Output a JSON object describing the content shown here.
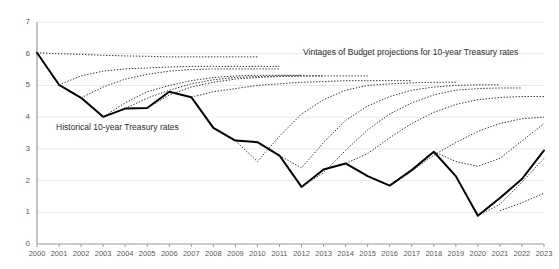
{
  "chart_data": {
    "type": "line",
    "title": "",
    "xlabel": "",
    "ylabel": "",
    "xlim": [
      2000,
      2023
    ],
    "ylim": [
      0,
      7
    ],
    "grid": true,
    "legend_position": "inline-annotations",
    "y_ticks": [
      "0",
      "1",
      "2",
      "3",
      "4",
      "5",
      "6",
      "7"
    ],
    "x_ticks": [
      "2000",
      "2001",
      "2002",
      "2003",
      "2004",
      "2005",
      "2006",
      "2007",
      "2008",
      "2009",
      "2010",
      "2011",
      "2012",
      "2013",
      "2014",
      "2015",
      "2016",
      "2017",
      "2018",
      "2019",
      "2020",
      "2021",
      "2022",
      "2023"
    ],
    "annotations": [
      {
        "name": "historical-label",
        "text": "Historical 10-year Treasury rates"
      },
      {
        "name": "vintages-label",
        "text": "Vintages of Budget projections for 10-year Treasury rates"
      }
    ],
    "series": [
      {
        "name": "Historical 10-year Treasury rates",
        "style": "solid",
        "color": "#000000",
        "x": [
          2000,
          2001,
          2002,
          2003,
          2004,
          2005,
          2006,
          2007,
          2008,
          2009,
          2010,
          2011,
          2012,
          2013,
          2014,
          2015,
          2016,
          2017,
          2018,
          2019,
          2020,
          2021,
          2022,
          2023
        ],
        "values": [
          6.03,
          5.02,
          4.61,
          4.01,
          4.27,
          4.29,
          4.8,
          4.63,
          3.66,
          3.26,
          3.21,
          2.79,
          1.8,
          2.35,
          2.54,
          2.14,
          1.84,
          2.33,
          2.91,
          2.14,
          0.89,
          1.45,
          2.05,
          2.95
        ]
      },
      {
        "name": "Budget projection vintage 2000",
        "style": "dotted",
        "color": "#333333",
        "x": [
          2000,
          2001,
          2002,
          2003,
          2004,
          2005,
          2006,
          2007,
          2008,
          2009,
          2010
        ],
        "values": [
          6.03,
          6.0,
          5.98,
          5.95,
          5.93,
          5.92,
          5.9,
          5.9,
          5.9,
          5.9,
          5.9
        ]
      },
      {
        "name": "Budget projection vintage 2001",
        "style": "dotted",
        "color": "#333333",
        "x": [
          2001,
          2002,
          2003,
          2004,
          2005,
          2006,
          2007,
          2008,
          2009,
          2010,
          2011
        ],
        "values": [
          5.02,
          5.3,
          5.45,
          5.52,
          5.55,
          5.58,
          5.6,
          5.6,
          5.6,
          5.6,
          5.6
        ]
      },
      {
        "name": "Budget projection vintage 2002",
        "style": "dotted",
        "color": "#333333",
        "x": [
          2002,
          2003,
          2004,
          2005,
          2006,
          2007,
          2008,
          2009,
          2010,
          2011
        ],
        "values": [
          4.61,
          4.95,
          5.2,
          5.35,
          5.45,
          5.5,
          5.52,
          5.52,
          5.52,
          5.52
        ]
      },
      {
        "name": "Budget projection vintage 2003",
        "style": "dotted",
        "color": "#333333",
        "x": [
          2003,
          2004,
          2005,
          2006,
          2007,
          2008,
          2009,
          2010,
          2011,
          2012
        ],
        "values": [
          4.01,
          4.45,
          4.8,
          5.0,
          5.15,
          5.25,
          5.3,
          5.32,
          5.32,
          5.32
        ]
      },
      {
        "name": "Budget projection vintage 2004",
        "style": "dotted",
        "color": "#333333",
        "x": [
          2004,
          2005,
          2006,
          2007,
          2008,
          2009,
          2010,
          2011,
          2012,
          2013
        ],
        "values": [
          4.27,
          4.6,
          4.85,
          5.05,
          5.18,
          5.25,
          5.28,
          5.3,
          5.3,
          5.3
        ]
      },
      {
        "name": "Budget projection vintage 2005",
        "style": "dotted",
        "color": "#333333",
        "x": [
          2005,
          2006,
          2007,
          2008,
          2009,
          2010,
          2011,
          2012,
          2013,
          2014,
          2015
        ],
        "values": [
          4.29,
          4.7,
          4.95,
          5.1,
          5.2,
          5.25,
          5.28,
          5.3,
          5.3,
          5.3,
          5.3
        ]
      },
      {
        "name": "Budget projection vintage 2007",
        "style": "dotted",
        "color": "#333333",
        "x": [
          2007,
          2008,
          2009,
          2010,
          2011,
          2012,
          2013,
          2014,
          2015,
          2016,
          2017
        ],
        "values": [
          4.63,
          4.8,
          4.9,
          5.0,
          5.05,
          5.1,
          5.12,
          5.15,
          5.15,
          5.15,
          5.15
        ]
      },
      {
        "name": "Budget projection vintage 2009",
        "style": "dotted",
        "color": "#333333",
        "x": [
          2009,
          2010,
          2011,
          2012,
          2013,
          2014,
          2015,
          2016,
          2017,
          2018,
          2019
        ],
        "values": [
          3.26,
          2.6,
          3.4,
          4.1,
          4.55,
          4.85,
          5.0,
          5.05,
          5.08,
          5.1,
          5.1
        ]
      },
      {
        "name": "Budget projection vintage 2011",
        "style": "dotted",
        "color": "#333333",
        "x": [
          2011,
          2012,
          2013,
          2014,
          2015,
          2016,
          2017,
          2018,
          2019,
          2020,
          2021
        ],
        "values": [
          2.79,
          2.4,
          3.2,
          3.9,
          4.35,
          4.65,
          4.85,
          4.95,
          5.0,
          5.02,
          5.02
        ]
      },
      {
        "name": "Budget projection vintage 2012",
        "style": "dotted",
        "color": "#333333",
        "x": [
          2012,
          2013,
          2014,
          2015,
          2016,
          2017,
          2018,
          2019,
          2020,
          2021,
          2022
        ],
        "values": [
          1.8,
          2.25,
          2.95,
          3.6,
          4.1,
          4.45,
          4.7,
          4.85,
          4.9,
          4.92,
          4.92
        ]
      },
      {
        "name": "Budget projection vintage 2014",
        "style": "dotted",
        "color": "#333333",
        "x": [
          2014,
          2015,
          2016,
          2017,
          2018,
          2019,
          2020,
          2021,
          2022,
          2023
        ],
        "values": [
          2.54,
          2.85,
          3.35,
          3.8,
          4.15,
          4.4,
          4.55,
          4.62,
          4.65,
          4.65
        ]
      },
      {
        "name": "Budget projection vintage 2016",
        "style": "dotted",
        "color": "#333333",
        "x": [
          2016,
          2017,
          2018,
          2019,
          2020,
          2021,
          2022,
          2023
        ],
        "values": [
          1.84,
          2.3,
          2.8,
          3.2,
          3.55,
          3.8,
          3.95,
          4.0
        ]
      },
      {
        "name": "Budget projection vintage 2018",
        "style": "dotted",
        "color": "#333333",
        "x": [
          2018,
          2019,
          2020,
          2021,
          2022,
          2023
        ],
        "values": [
          2.91,
          2.6,
          2.45,
          2.7,
          3.25,
          3.8
        ]
      },
      {
        "name": "Budget projection vintage 2020",
        "style": "dotted",
        "color": "#333333",
        "x": [
          2020,
          2021,
          2022,
          2023
        ],
        "values": [
          0.89,
          1.25,
          1.95,
          2.7
        ]
      },
      {
        "name": "Budget projection vintage 2021",
        "style": "dotted",
        "color": "#333333",
        "x": [
          2021,
          2022,
          2023
        ],
        "values": [
          1.05,
          1.3,
          1.6
        ]
      }
    ]
  }
}
